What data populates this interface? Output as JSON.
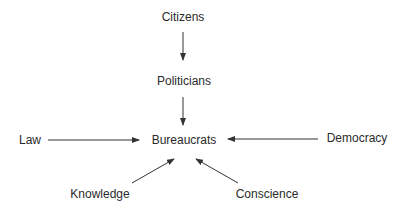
{
  "diagram": {
    "nodes": [
      {
        "id": "citizens",
        "label": "Citizens",
        "x": 183,
        "y": 17
      },
      {
        "id": "politicians",
        "label": "Politicians",
        "x": 184,
        "y": 81
      },
      {
        "id": "bureaucrats",
        "label": "Bureaucrats",
        "x": 184,
        "y": 140
      },
      {
        "id": "law",
        "label": "Law",
        "x": 30,
        "y": 140
      },
      {
        "id": "democracy",
        "label": "Democracy",
        "x": 357,
        "y": 138
      },
      {
        "id": "knowledge",
        "label": "Knowledge",
        "x": 100,
        "y": 194
      },
      {
        "id": "conscience",
        "label": "Conscience",
        "x": 267,
        "y": 194
      }
    ],
    "edges": [
      {
        "from": "citizens",
        "to": "politicians"
      },
      {
        "from": "politicians",
        "to": "bureaucrats"
      },
      {
        "from": "law",
        "to": "bureaucrats"
      },
      {
        "from": "democracy",
        "to": "bureaucrats"
      },
      {
        "from": "knowledge",
        "to": "bureaucrats"
      },
      {
        "from": "conscience",
        "to": "bureaucrats"
      }
    ],
    "colors": {
      "line": "#333333",
      "text": "#2a2a2a"
    }
  }
}
